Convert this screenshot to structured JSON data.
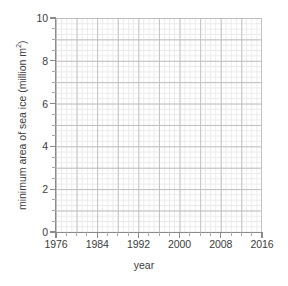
{
  "chart_data": {
    "type": "line",
    "title": "",
    "subtitle": "",
    "xlabel": "year",
    "ylabel_text": "minimum area of sea ice (million m",
    "ylabel_sup": "2",
    "ylabel_tail": ")",
    "ylabel_full": "minimum area of sea ice (million m2)",
    "x": [],
    "values": [],
    "series": [],
    "annotations": [],
    "legend": [],
    "legend_position": "none",
    "grid": true,
    "grid_major_x_step": 8,
    "grid_minor_x_step": 2,
    "grid_major_y_step": 2,
    "grid_minor_y_step": 0.5,
    "xlim": [
      1976,
      2016
    ],
    "ylim": [
      0,
      10
    ],
    "x_tick_labels": [
      "1976",
      "1984",
      "1992",
      "2000",
      "2008",
      "2016"
    ],
    "x_tick_values": [
      1976,
      1984,
      1992,
      2000,
      2008,
      2016
    ],
    "y_tick_labels": [
      "0",
      "2",
      "4",
      "6",
      "8",
      "10"
    ],
    "y_tick_values": [
      0,
      2,
      4,
      6,
      8,
      10
    ],
    "note": "blank grid template, no data series plotted"
  },
  "colors": {
    "background": "#ffffff",
    "grid_minor": "#e9e9e9",
    "grid_major": "#c2c2c2",
    "axis_line": "#8a8a8a",
    "tick_minor": "#a9a9a9",
    "text": "#3b3b3b"
  }
}
